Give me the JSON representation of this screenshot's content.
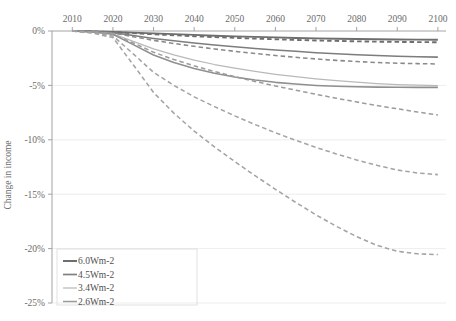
{
  "chart_data": {
    "type": "line",
    "title": "",
    "xlabel": "",
    "ylabel": "Change in income",
    "xlim": [
      2005,
      2102
    ],
    "ylim": [
      -25,
      0
    ],
    "xticks": [
      2010,
      2020,
      2030,
      2040,
      2050,
      2060,
      2070,
      2080,
      2090,
      2100
    ],
    "xtick_labels": [
      "2010",
      "2020",
      "2030",
      "2040",
      "2050",
      "2060",
      "2070",
      "2080",
      "2090",
      "2100"
    ],
    "yticks": [
      0,
      -5,
      -10,
      -15,
      -20,
      -25
    ],
    "ytick_labels": [
      "0%",
      "-5%",
      "-10%",
      "-15%",
      "-20%",
      "-25%"
    ],
    "grid": true,
    "legend_position": "bottom-left",
    "x": [
      2010,
      2015,
      2020,
      2025,
      2030,
      2035,
      2040,
      2045,
      2050,
      2055,
      2060,
      2065,
      2070,
      2075,
      2080,
      2085,
      2090,
      2095,
      2100
    ],
    "series": [
      {
        "name": "6.0Wm-2",
        "label": "6.0Wm-2",
        "style": "solid",
        "color": "#6e6e6e",
        "values": [
          0,
          -0.03,
          -0.08,
          -0.15,
          -0.22,
          -0.29,
          -0.36,
          -0.43,
          -0.49,
          -0.54,
          -0.59,
          -0.64,
          -0.68,
          -0.71,
          -0.74,
          -0.76,
          -0.78,
          -0.79,
          -0.8
        ]
      },
      {
        "name": "6.0Wm-2-dashed",
        "label": "6.0Wm-2",
        "style": "dashed",
        "color": "#6e6e6e",
        "values": [
          0,
          -0.04,
          -0.1,
          -0.2,
          -0.3,
          -0.39,
          -0.48,
          -0.56,
          -0.63,
          -0.7,
          -0.76,
          -0.82,
          -0.87,
          -0.91,
          -0.95,
          -0.98,
          -1.0,
          -1.02,
          -1.03
        ]
      },
      {
        "name": "4.5Wm-2",
        "label": "4.5Wm-2",
        "style": "solid",
        "color": "#7d7d7d",
        "values": [
          0,
          -0.05,
          -0.15,
          -0.42,
          -0.68,
          -0.9,
          -1.1,
          -1.28,
          -1.45,
          -1.6,
          -1.74,
          -1.87,
          -1.99,
          -2.09,
          -2.18,
          -2.26,
          -2.32,
          -2.37,
          -2.4
        ]
      },
      {
        "name": "4.5Wm-2-dashed",
        "label": "4.5Wm-2",
        "style": "dashed",
        "color": "#8a8a8a",
        "values": [
          0,
          -0.06,
          -0.18,
          -0.52,
          -0.86,
          -1.15,
          -1.41,
          -1.65,
          -1.87,
          -2.07,
          -2.25,
          -2.42,
          -2.57,
          -2.7,
          -2.81,
          -2.9,
          -2.96,
          -3.0,
          -3.03
        ]
      },
      {
        "name": "3.4Wm-2",
        "label": "3.4Wm-2",
        "style": "solid",
        "color": "#b9b9b9",
        "values": [
          0,
          -0.08,
          -0.25,
          -0.95,
          -1.65,
          -2.2,
          -2.68,
          -3.08,
          -3.42,
          -3.72,
          -3.98,
          -4.2,
          -4.4,
          -4.57,
          -4.71,
          -4.83,
          -4.92,
          -4.98,
          -5.02
        ]
      },
      {
        "name": "2.6Wm-2",
        "label": "2.6Wm-2",
        "style": "solid",
        "color": "#8f8f8f",
        "values": [
          0,
          -0.1,
          -0.3,
          -1.25,
          -2.2,
          -2.9,
          -3.45,
          -3.88,
          -4.22,
          -4.5,
          -4.72,
          -4.88,
          -5.0,
          -5.08,
          -5.13,
          -5.16,
          -5.17,
          -5.18,
          -5.18
        ]
      },
      {
        "name": "3.4Wm-2-dashed",
        "label": "3.4Wm-2",
        "style": "dashed",
        "color": "#9c9c9c",
        "values": [
          0,
          -0.1,
          -0.32,
          -1.1,
          -1.95,
          -2.62,
          -3.2,
          -3.72,
          -4.2,
          -4.64,
          -5.05,
          -5.44,
          -5.82,
          -6.18,
          -6.52,
          -6.85,
          -7.15,
          -7.45,
          -7.72
        ]
      },
      {
        "name": "2.6Wm-2-dashed",
        "label": "2.6Wm-2",
        "style": "dashed",
        "color": "#a4a4a4",
        "values": [
          0,
          -0.15,
          -0.45,
          -2.1,
          -3.8,
          -5.0,
          -6.05,
          -6.95,
          -7.8,
          -8.6,
          -9.35,
          -10.05,
          -10.7,
          -11.3,
          -11.85,
          -12.35,
          -12.78,
          -13.05,
          -13.2
        ]
      },
      {
        "name": "2.6Wm-2-dashed-low",
        "label": "2.6Wm-2",
        "style": "dashed",
        "color": "#a4a4a4",
        "values": [
          0,
          -0.2,
          -0.6,
          -3.1,
          -5.65,
          -7.55,
          -9.2,
          -10.65,
          -12.0,
          -13.3,
          -14.55,
          -15.75,
          -16.9,
          -17.95,
          -18.9,
          -19.7,
          -20.25,
          -20.48,
          -20.55
        ]
      }
    ],
    "legend": [
      {
        "label": "6.0Wm-2",
        "color": "#6e6e6e",
        "width": 2.0
      },
      {
        "label": "4.5Wm-2",
        "color": "#808080",
        "width": 1.7
      },
      {
        "label": "3.4Wm-2",
        "color": "#bdbdbd",
        "width": 1.3
      },
      {
        "label": "2.6Wm-2",
        "color": "#9a9a9a",
        "width": 1.5
      }
    ]
  }
}
